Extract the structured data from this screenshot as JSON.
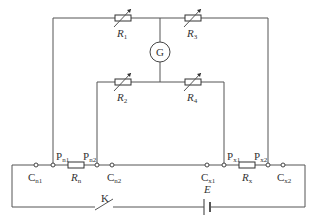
{
  "diagram": {
    "type": "Kelvin double bridge circuit",
    "components": {
      "R1": {
        "label": "R",
        "sub": "1",
        "kind": "variable-resistor"
      },
      "R2": {
        "label": "R",
        "sub": "2",
        "kind": "variable-resistor"
      },
      "R3": {
        "label": "R",
        "sub": "3",
        "kind": "variable-resistor"
      },
      "R4": {
        "label": "R",
        "sub": "4",
        "kind": "variable-resistor"
      },
      "Rn": {
        "label": "R",
        "sub": "n",
        "kind": "resistor"
      },
      "Rx": {
        "label": "R",
        "sub": "x",
        "kind": "resistor"
      },
      "G": {
        "label": "G",
        "kind": "galvanometer"
      },
      "K": {
        "label": "K",
        "kind": "switch"
      },
      "E": {
        "label": "E",
        "kind": "battery"
      }
    },
    "terminals": {
      "Cn1": {
        "label": "C",
        "sub": "n1"
      },
      "Pn1": {
        "label": "P",
        "sub": "n1"
      },
      "Pn2": {
        "label": "P",
        "sub": "n2"
      },
      "Cn2": {
        "label": "C",
        "sub": "n2"
      },
      "Cx1": {
        "label": "C",
        "sub": "x1"
      },
      "Px1": {
        "label": "P",
        "sub": "x1"
      },
      "Px2": {
        "label": "P",
        "sub": "x2"
      },
      "Cx2": {
        "label": "C",
        "sub": "x2"
      }
    }
  }
}
